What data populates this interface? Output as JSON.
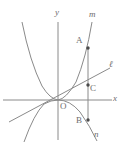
{
  "figure": {
    "background_color": "#ffffff",
    "stroke_color": "#8a8a8a",
    "point_color": "#4a4a4a",
    "label_color": "#6d6d6d",
    "axes": {
      "x_label": "x",
      "y_label": "y",
      "origin_label": "O",
      "origin_px": {
        "x": 58,
        "y": 100
      }
    },
    "curves": [
      {
        "id": "m",
        "label": "m",
        "type": "parabola-opening-up",
        "vertex_px": {
          "x": 58,
          "y": 100
        },
        "label_px": {
          "x": 90,
          "y": 12
        }
      },
      {
        "id": "n",
        "label": "n",
        "type": "parabola-opening-down",
        "vertex_px": {
          "x": 58,
          "y": 100
        },
        "label_px": {
          "x": 95,
          "y": 132
        }
      },
      {
        "id": "l",
        "label": "ℓ",
        "type": "line-through-origin",
        "label_px": {
          "x": 110,
          "y": 62
        }
      }
    ],
    "points": [
      {
        "label": "A",
        "px": {
          "x": 88,
          "y": 48
        },
        "label_px": {
          "x": 76,
          "y": 38
        }
      },
      {
        "label": "C",
        "px": {
          "x": 88,
          "y": 85
        },
        "label_px": {
          "x": 91,
          "y": 86
        }
      },
      {
        "label": "B",
        "px": {
          "x": 88,
          "y": 120
        },
        "label_px": {
          "x": 76,
          "y": 118
        }
      }
    ],
    "segments": [
      {
        "id": "AB",
        "from": "A",
        "to": "B",
        "description": "vertical-segment-through-C"
      }
    ]
  }
}
